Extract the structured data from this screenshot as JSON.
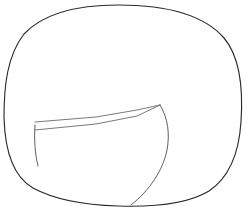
{
  "figure": {
    "background_color": "#ffffff",
    "outline_color": "#2b2b2b",
    "inner_line_color": "#6a6a6a",
    "canvas": {
      "width": 248,
      "height": 211
    },
    "shapes": [
      {
        "name": "outer-blob-outline",
        "kind": "closed-curve",
        "stroke": "#2b2b2b",
        "stroke_width": 1.15,
        "fill": "none",
        "extents": {
          "left": 4,
          "right": 243,
          "top": 5,
          "bottom": 206
        },
        "path": "M 118 5 C 170 5 205 16 224 38 C 241 58 243 92 241 122 C 239 152 230 177 209 191 C 186 205 150 207 118 206 C 86 205 55 200 33 188 C 12 176 5 150 4 118 C 4 86 7 56 24 34 C 44 13 78 5 118 5 Z"
      },
      {
        "name": "inner-wedge-upper-edge",
        "kind": "open-curve",
        "stroke": "#6a6a6a",
        "stroke_width": 0.9,
        "fill": "none",
        "path": "M 35 122 L 96 117 L 137 110 L 160 105"
      },
      {
        "name": "inner-wedge-lower-edge",
        "kind": "open-curve",
        "stroke": "#6a6a6a",
        "stroke_width": 0.9,
        "fill": "none",
        "path": "M 35 130 L 96 124 L 137 116 L 160 105"
      },
      {
        "name": "inner-right-arc",
        "kind": "open-curve",
        "stroke": "#555555",
        "stroke_width": 0.95,
        "fill": "none",
        "path": "M 160 105 C 168 118 170 134 167 150 C 163 170 150 190 131 205"
      },
      {
        "name": "inner-left-descender",
        "kind": "open-curve",
        "stroke": "#555555",
        "stroke_width": 0.95,
        "fill": "none",
        "path": "M 35 125 C 34 140 35 154 38 166"
      }
    ]
  }
}
